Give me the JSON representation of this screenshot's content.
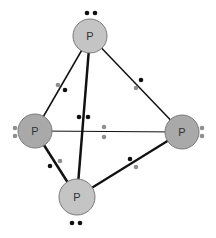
{
  "diagram": {
    "colors": {
      "atom_fill_light": "#c4c4c4",
      "atom_fill_dark": "#a9a9a9",
      "atom_stroke": "#7a7a7a",
      "bond": "#111111",
      "electron_black": "#111111",
      "electron_gray": "#8f8f8f"
    },
    "atoms": [
      {
        "id": "top",
        "label": "P",
        "x": 90,
        "y": 36,
        "r": 17,
        "fill": "light"
      },
      {
        "id": "left",
        "label": "P",
        "x": 35,
        "y": 131,
        "r": 17,
        "fill": "dark"
      },
      {
        "id": "right",
        "label": "P",
        "x": 182,
        "y": 132,
        "r": 17,
        "fill": "dark"
      },
      {
        "id": "bottom",
        "label": "P",
        "x": 77,
        "y": 197,
        "r": 18,
        "fill": "light"
      }
    ],
    "bonds": [
      {
        "from": "top",
        "to": "left",
        "width": 1.5
      },
      {
        "from": "top",
        "to": "right",
        "width": 1.5
      },
      {
        "from": "top",
        "to": "bottom",
        "width": 2.5
      },
      {
        "from": "left",
        "to": "right",
        "width": 1.2
      },
      {
        "from": "left",
        "to": "bottom",
        "width": 2.5
      },
      {
        "from": "right",
        "to": "bottom",
        "width": 2.2
      }
    ],
    "electrons": [
      {
        "x": 87,
        "y": 13,
        "color": "black",
        "group": "lone-pair-top"
      },
      {
        "x": 95,
        "y": 13,
        "color": "black",
        "group": "lone-pair-top"
      },
      {
        "x": 15,
        "y": 128,
        "color": "gray",
        "group": "lone-pair-left"
      },
      {
        "x": 15,
        "y": 136,
        "color": "gray",
        "group": "lone-pair-left"
      },
      {
        "x": 202,
        "y": 128,
        "color": "gray",
        "group": "lone-pair-right"
      },
      {
        "x": 202,
        "y": 136,
        "color": "gray",
        "group": "lone-pair-right"
      },
      {
        "x": 72,
        "y": 223,
        "color": "black",
        "group": "lone-pair-bottom"
      },
      {
        "x": 80,
        "y": 223,
        "color": "black",
        "group": "lone-pair-bottom"
      },
      {
        "x": 58,
        "y": 85,
        "color": "gray",
        "group": "bond-top-left"
      },
      {
        "x": 65,
        "y": 90,
        "color": "black",
        "group": "bond-top-left"
      },
      {
        "x": 141,
        "y": 80,
        "color": "black",
        "group": "bond-top-right"
      },
      {
        "x": 136,
        "y": 88,
        "color": "gray",
        "group": "bond-top-right"
      },
      {
        "x": 79,
        "y": 117,
        "color": "black",
        "group": "bond-top-bottom"
      },
      {
        "x": 88,
        "y": 117,
        "color": "black",
        "group": "bond-top-bottom"
      },
      {
        "x": 104,
        "y": 127,
        "color": "gray",
        "group": "bond-left-right"
      },
      {
        "x": 104,
        "y": 137,
        "color": "gray",
        "group": "bond-left-right"
      },
      {
        "x": 50,
        "y": 166,
        "color": "black",
        "group": "bond-left-bottom"
      },
      {
        "x": 60,
        "y": 161,
        "color": "gray",
        "group": "bond-left-bottom"
      },
      {
        "x": 130,
        "y": 159,
        "color": "black",
        "group": "bond-right-bottom"
      },
      {
        "x": 136,
        "y": 167,
        "color": "gray",
        "group": "bond-right-bottom"
      }
    ]
  }
}
